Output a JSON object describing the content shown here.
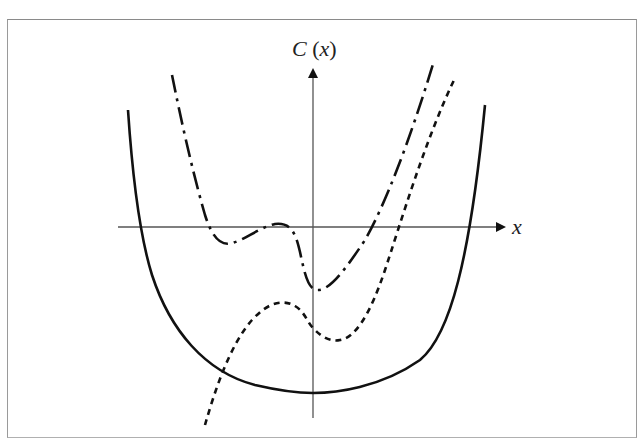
{
  "figure": {
    "y_axis_label_func": "C",
    "y_axis_label_open": " (",
    "y_axis_label_var": "x",
    "y_axis_label_close": ")",
    "x_axis_label": "x"
  },
  "curves": [
    {
      "name": "solid-curve",
      "style": "solid",
      "description": "U-shaped curve, broad flat minimum below the x-axis"
    },
    {
      "name": "dash-dot-curve",
      "style": "dash-dot",
      "description": "Curve with local min left of y-axis, local max near x-axis, then min just right of y-axis, rising steeply"
    },
    {
      "name": "dotted-curve",
      "style": "short-dash",
      "description": "Cubic-like curve rising from lower left, local max left of y-axis, local min right of y-axis, rising steeply"
    }
  ],
  "colors": {
    "curve": "#111111",
    "axis": "#555555",
    "frame": "#8a8a8a"
  }
}
